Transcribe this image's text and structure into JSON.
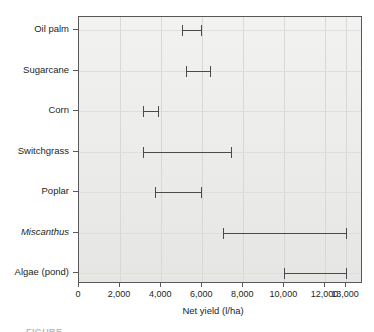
{
  "chart_data": {
    "type": "bar",
    "orientation": "horizontal",
    "subtype": "range-dot-plot",
    "title": "",
    "xlabel": "Net yield (l/ha)",
    "ylabel": "",
    "xlim": [
      0,
      13600
    ],
    "grid": true,
    "legend": null,
    "categories": [
      "Oil palm",
      "Sugarcane",
      "Corn",
      "Switchgrass",
      "Poplar",
      "Miscanthus",
      "Algae (pond)"
    ],
    "category_styles": [
      "normal",
      "normal",
      "normal",
      "normal",
      "normal",
      "italic",
      "normal"
    ],
    "ranges": [
      {
        "category": "Oil palm",
        "low": 5000,
        "high": 5950
      },
      {
        "category": "Sugarcane",
        "low": 5200,
        "high": 6400
      },
      {
        "category": "Corn",
        "low": 3100,
        "high": 3850
      },
      {
        "category": "Switchgrass",
        "low": 3100,
        "high": 7400
      },
      {
        "category": "Poplar",
        "low": 3700,
        "high": 5950
      },
      {
        "category": "Miscanthus",
        "low": 7000,
        "high": 13000
      },
      {
        "category": "Algae (pond)",
        "low": 10000,
        "high": 13000
      }
    ],
    "xticks": [
      0,
      2000,
      4000,
      6000,
      8000,
      10000,
      12000,
      13000
    ],
    "xtick_labels": [
      "0",
      "2,000",
      "4,000",
      "6,000",
      "8,000",
      "10,000",
      "12,000",
      "13,000"
    ],
    "gridline_values": [
      2000,
      4000,
      6000,
      8000,
      10000,
      12000,
      13000
    ],
    "colors": {
      "plot_background": "#ecebe9",
      "plot_border": "#58585a",
      "gridline": "#d8d8d6",
      "marker": "#4a4a4c",
      "text": "#231f20"
    }
  },
  "caption": {
    "partial_text": "FIGURE"
  }
}
